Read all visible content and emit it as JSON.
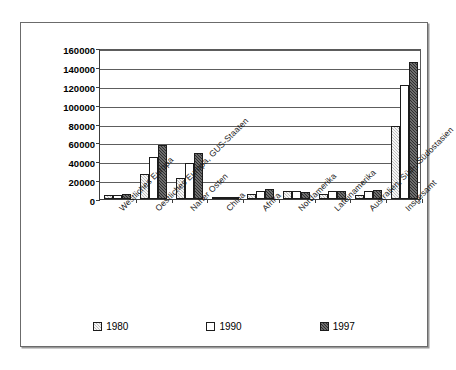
{
  "chart_data": {
    "type": "bar",
    "title": "",
    "subtitle": "",
    "xlabel": "",
    "ylabel": "",
    "ylim": [
      0,
      160000
    ],
    "ytick_step": 20000,
    "yticks": [
      0,
      20000,
      40000,
      60000,
      80000,
      100000,
      120000,
      140000,
      160000
    ],
    "ytick_labels": [
      "0",
      "20000",
      "40000",
      "60000",
      "80000",
      "100000",
      "120000",
      "140000",
      "160000"
    ],
    "grid": true,
    "legend_position": "bottom",
    "categories": [
      "Westliches Europa",
      "Oestliches Europa, GUS-Staaten",
      "Naher Osten",
      "China",
      "Afrika",
      "Nordamerika",
      "Lateinamerika",
      "Australien, Süd-, Südostasien",
      "Insgesamt"
    ],
    "series": [
      {
        "name": "1980",
        "color": "#bfbfbf",
        "values": [
          3800,
          27000,
          22000,
          500,
          5800,
          8500,
          5200,
          4300,
          77000
        ]
      },
      {
        "name": "1990",
        "color": "#ffffff",
        "values": [
          4600,
          44000,
          38000,
          900,
          8200,
          8800,
          8000,
          8000,
          121000
        ]
      },
      {
        "name": "1997",
        "color": "#2e2e2e",
        "values": [
          4800,
          57000,
          49000,
          1700,
          10500,
          7500,
          9000,
          10000,
          145500
        ]
      }
    ]
  },
  "legend": {
    "items": [
      {
        "label": "1980",
        "swatch": "legend-swatch-1980"
      },
      {
        "label": "1990",
        "swatch": "legend-swatch-1990"
      },
      {
        "label": "1997",
        "swatch": "legend-swatch-1997"
      }
    ]
  }
}
